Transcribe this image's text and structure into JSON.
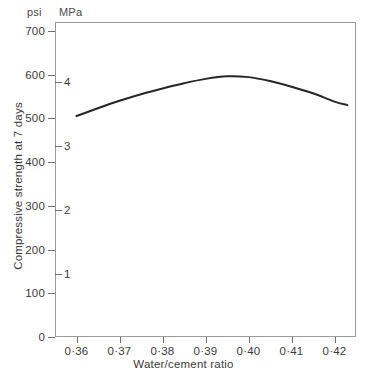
{
  "chart_data": {
    "type": "line",
    "title": "",
    "xlabel": "Water/cement ratio",
    "ylabel": "Compressive strength at 7 days",
    "unit_primary": "psi",
    "unit_secondary": "MPa",
    "xlim": [
      0.355,
      0.425
    ],
    "ylim": [
      0,
      720
    ],
    "ylim_secondary": [
      0,
      4.73
    ],
    "grid": false,
    "legend": null,
    "x_ticks": [
      0.36,
      0.37,
      0.38,
      0.39,
      0.4,
      0.41,
      0.42
    ],
    "x_tick_labels": [
      "0·36",
      "0·37",
      "0·38",
      "0·39",
      "0·40",
      "0·41",
      "0·42"
    ],
    "y_ticks": [
      0,
      100,
      200,
      300,
      400,
      500,
      600,
      700
    ],
    "y_tick_labels": [
      "0",
      "100",
      "200",
      "300",
      "400",
      "500",
      "600",
      "700"
    ],
    "y_ticks_secondary": [
      1,
      2,
      3,
      4
    ],
    "y_tick_labels_secondary": [
      "1",
      "2",
      "3",
      "4"
    ],
    "series": [
      {
        "name": "Compressive strength",
        "color": "#262626",
        "line_width": 2,
        "x": [
          0.36,
          0.365,
          0.37,
          0.375,
          0.38,
          0.385,
          0.39,
          0.395,
          0.4,
          0.405,
          0.41,
          0.415,
          0.42,
          0.423
        ],
        "y": [
          505,
          523,
          540,
          555,
          568,
          580,
          590,
          596,
          594,
          585,
          572,
          557,
          538,
          530
        ]
      }
    ]
  },
  "axes": {
    "unit_primary_label": "psi",
    "unit_secondary_label": "MPa",
    "x_axis_title": "Water/cement ratio",
    "y_axis_title": "Compressive strength at 7 days"
  },
  "style": {
    "frame_color": "#9a9a9a",
    "tick_color": "#6f6f6f",
    "text_color": "#3a3a3a",
    "curve_color": "#262626",
    "background": "#ffffff"
  }
}
